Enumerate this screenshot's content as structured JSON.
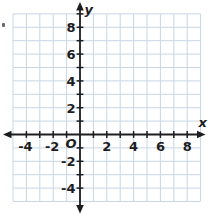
{
  "chart_data": {
    "type": "scatter",
    "title": "",
    "grid": true,
    "legend": false,
    "series": [],
    "x_axis": {
      "label": "x",
      "min": -5,
      "max": 9,
      "tick_step": 1,
      "labeled_ticks": [
        {
          "value": -4,
          "label": "-4"
        },
        {
          "value": -2,
          "label": "-2"
        },
        {
          "value": 2,
          "label": "2"
        },
        {
          "value": 4,
          "label": "4"
        },
        {
          "value": 6,
          "label": "6"
        },
        {
          "value": 8,
          "label": "8"
        }
      ]
    },
    "y_axis": {
      "label": "y",
      "min": -5,
      "max": 9,
      "tick_step": 1,
      "labeled_ticks": [
        {
          "value": 8,
          "label": "8"
        },
        {
          "value": 6,
          "label": "6"
        },
        {
          "value": 4,
          "label": "4"
        },
        {
          "value": 2,
          "label": "2"
        },
        {
          "value": -2,
          "label": "-2"
        },
        {
          "value": -4,
          "label": "-4"
        }
      ]
    },
    "origin_label": "O"
  },
  "colors": {
    "background": "#ffffff",
    "grid": "#c8d6e4",
    "axis": "#1d1d1f",
    "text": "#1d1d1f",
    "artifact": "#6a6a6a"
  }
}
